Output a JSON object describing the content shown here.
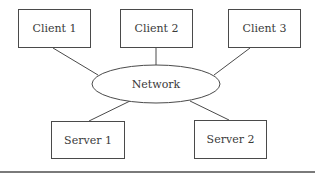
{
  "diagram": {
    "type": "network-topology",
    "hub": {
      "id": "network",
      "label": "Network",
      "shape": "ellipse"
    },
    "nodes": [
      {
        "id": "client1",
        "label": "Client 1",
        "shape": "rectangle",
        "role": "client"
      },
      {
        "id": "client2",
        "label": "Client 2",
        "shape": "rectangle",
        "role": "client"
      },
      {
        "id": "client3",
        "label": "Client 3",
        "shape": "rectangle",
        "role": "client"
      },
      {
        "id": "server1",
        "label": "Server 1",
        "shape": "rectangle",
        "role": "server"
      },
      {
        "id": "server2",
        "label": "Server 2",
        "shape": "rectangle",
        "role": "server"
      }
    ],
    "edges": [
      {
        "from": "client1",
        "to": "network"
      },
      {
        "from": "client2",
        "to": "network"
      },
      {
        "from": "client3",
        "to": "network"
      },
      {
        "from": "server1",
        "to": "network"
      },
      {
        "from": "server2",
        "to": "network"
      }
    ]
  },
  "colors": {
    "stroke": "#4a4a4a",
    "text": "#3a3a3a",
    "background": "#ffffff",
    "rule": "#7a7a7a"
  }
}
